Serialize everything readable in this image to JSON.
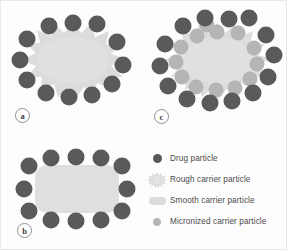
{
  "figure": {
    "background_color": "#fdfdfd",
    "border_color": "#e8e8e8"
  },
  "colors": {
    "drug_particle": "#5a5a5a",
    "drug_particle_edge": "#4e4e4e",
    "micronized_particle": "#b0b0b0",
    "carrier_fill": "#dcdcdc",
    "carrier_fill_light": "#e2e2e2",
    "text": "#4a4a4a",
    "label_outline": "#8f8f8f"
  },
  "panels": [
    {
      "id": "a",
      "label": "a",
      "carrier_type": "rough",
      "description": "Rough carrier particle surrounded by drug particles",
      "drug_particle_count": 12,
      "micronized_particle_count": 0
    },
    {
      "id": "b",
      "label": "b",
      "carrier_type": "smooth",
      "description": "Smooth carrier particle surrounded by drug particles",
      "drug_particle_count": 12,
      "micronized_particle_count": 0
    },
    {
      "id": "c",
      "label": "c",
      "carrier_type": "rough",
      "description": "Rough carrier particle with micronized carrier particles and drug particles",
      "drug_particle_count": 14,
      "micronized_particle_count": 13
    }
  ],
  "legend": {
    "items": [
      {
        "swatch": "drug-particle-swatch",
        "label": "Drug particle",
        "color": "#5a5a5a"
      },
      {
        "swatch": "rough-carrier-swatch",
        "label": "Rough carrier particle",
        "color": "#dcdcdc"
      },
      {
        "swatch": "smooth-carrier-swatch",
        "label": "Smooth carrier particle",
        "color": "#dcdcdc"
      },
      {
        "swatch": "micronized-carrier-swatch",
        "label": "Micronized carrier particle",
        "color": "#b0b0b0"
      }
    ]
  }
}
